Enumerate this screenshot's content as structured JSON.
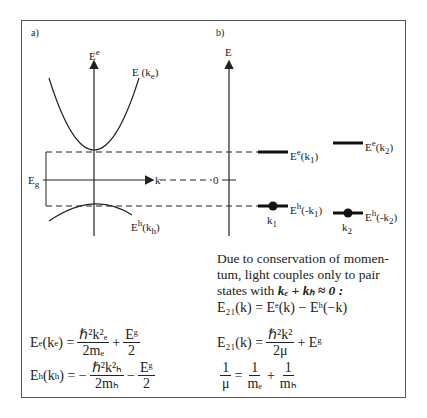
{
  "panel_a": {
    "label": "a)",
    "axis_y_label": "E",
    "axis_y_sup": "e",
    "axis_x_label": "k",
    "conduction_band_label": "E (k",
    "conduction_band_sub": "e",
    "valence_band_label": "E",
    "valence_band_sup": "h",
    "valence_band_arg": "(k",
    "valence_band_sub": "h",
    "gap_label": "E",
    "gap_sub": "g"
  },
  "panel_b": {
    "label": "b)",
    "axis_label": "E",
    "zero_label": "0",
    "levels": [
      {
        "label": "E",
        "sup": "e",
        "arg": "(k",
        "sub": "1",
        "tail": ")"
      },
      {
        "label": "E",
        "sup": "e",
        "arg": "(k",
        "sub": "2",
        "tail": ")"
      },
      {
        "label": "E",
        "sup": "h",
        "arg": "(-k",
        "sub": "1",
        "tail": ")"
      },
      {
        "label": "E",
        "sup": "h",
        "arg": "(-k",
        "sub": "2",
        "tail": ")"
      }
    ],
    "dot_labels": [
      {
        "label": "k",
        "sub": "1"
      },
      {
        "label": "k",
        "sub": "2"
      }
    ]
  },
  "text": {
    "paragraph_line1": "Due to conservation of momen-",
    "paragraph_line2": "tum, light couples only to pair",
    "paragraph_line3": "states with",
    "paragraph_cond": "kₑ + kₕ ≈ 0 :"
  },
  "equations": {
    "eq_e": {
      "lhs": "E",
      "lhs_sup": "e",
      "arg": "(k",
      "arg_sub": "e",
      "eq": ") =",
      "num": "ℏ²k²ₑ",
      "den": "2mₑ",
      "plus": "+",
      "num2": "Eᵍ",
      "den2": "2"
    },
    "eq_h": {
      "lhs": "E",
      "lhs_sup": "h",
      "arg": "(k",
      "arg_sub": "h",
      "eq": ") = −",
      "num": "ℏ²k²ₕ",
      "den": "2mₕ",
      "minus": "−",
      "num2": "Eᵍ",
      "den2": "2"
    },
    "eq_21a": "E₂₁(k) = Eᵉ(k) − Eʰ(−k)",
    "eq_21b_lhs": "E₂₁(k) =",
    "eq_21b_num": "ℏ²k²",
    "eq_21b_den": "2μ",
    "eq_21b_tail": "+ Eᵍ",
    "eq_mu_lhs_num": "1",
    "eq_mu_lhs_den": "μ",
    "eq_mu_eq": "=",
    "eq_mu_n1": "1",
    "eq_mu_d1": "mₑ",
    "eq_mu_plus": "+",
    "eq_mu_n2": "1",
    "eq_mu_d2": "mₕ"
  },
  "colors": {
    "line": "#222222",
    "frame": "#555555"
  }
}
